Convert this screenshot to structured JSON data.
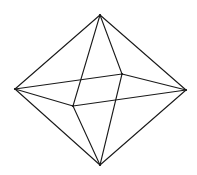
{
  "diagram": {
    "title": "",
    "shape": "octahedron-wireframe",
    "stroke_color": "#1a1a1a",
    "background": "#ffffff",
    "vertices": {
      "top": [
        100,
        15
      ],
      "left": [
        15,
        89
      ],
      "right": [
        186,
        90
      ],
      "bottom": [
        100,
        165
      ],
      "back_right": [
        122,
        74
      ],
      "front_left": [
        73,
        106
      ]
    },
    "edges": [
      [
        "top",
        "left"
      ],
      [
        "top",
        "right"
      ],
      [
        "top",
        "front_left"
      ],
      [
        "top",
        "back_right"
      ],
      [
        "bottom",
        "left"
      ],
      [
        "bottom",
        "right"
      ],
      [
        "bottom",
        "front_left"
      ],
      [
        "bottom",
        "back_right"
      ],
      [
        "left",
        "back_right"
      ],
      [
        "left",
        "front_left"
      ],
      [
        "right",
        "back_right"
      ],
      [
        "right",
        "front_left"
      ]
    ]
  }
}
